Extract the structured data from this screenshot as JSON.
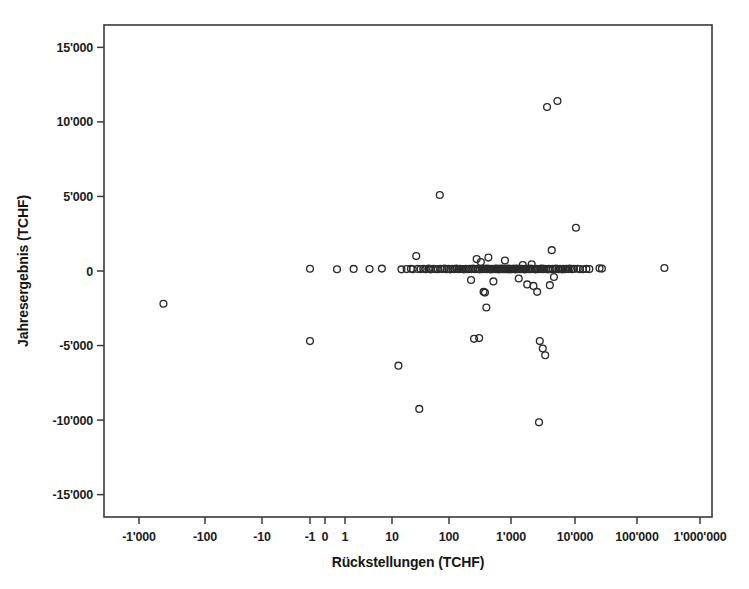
{
  "chart_data": {
    "type": "scatter",
    "title": "",
    "xlabel": "Rückstellungen (TCHF)",
    "ylabel": "Jahresergebnis (TCHF)",
    "xscale": "symlog",
    "yscale": "linear",
    "grid": false,
    "legend": false,
    "marker_style": "open-circle",
    "marker_color": "#2b2b2b",
    "x_tick_labels": [
      "-1'000",
      "-100",
      "-10",
      "-1",
      "0",
      "1",
      "10",
      "100",
      "1'000",
      "10'000",
      "100'000",
      "1'000'000"
    ],
    "x_tick_values": [
      -1000,
      -100,
      -10,
      -1,
      0,
      1,
      10,
      100,
      1000,
      10000,
      100000,
      1000000
    ],
    "x_tick_px": [
      139,
      205,
      262,
      310,
      325,
      345,
      392,
      449,
      511,
      575,
      637,
      700
    ],
    "y_tick_labels": [
      "15'000",
      "10'000",
      "5'000",
      "0",
      "-5'000",
      "-10'000",
      "-15'000"
    ],
    "y_tick_values": [
      15000,
      10000,
      5000,
      0,
      -5000,
      -10000,
      -15000
    ],
    "ylim": [
      -16500,
      16500
    ],
    "xlim_px": [
      104,
      712
    ],
    "ylim_px": [
      25,
      517
    ],
    "points": [
      [
        -300,
        -2200
      ],
      [
        -1,
        -4700
      ],
      [
        -1,
        150
      ],
      [
        0.6,
        120
      ],
      [
        1.4,
        140
      ],
      [
        2.6,
        130
      ],
      [
        4.2,
        160
      ],
      [
        8,
        -6350
      ],
      [
        9,
        110
      ],
      [
        11,
        130
      ],
      [
        13,
        150
      ],
      [
        14,
        120
      ],
      [
        16,
        1000
      ],
      [
        17,
        140
      ],
      [
        18,
        -9250
      ],
      [
        19,
        130
      ],
      [
        21,
        150
      ],
      [
        23,
        120
      ],
      [
        26,
        160
      ],
      [
        28,
        110
      ],
      [
        31,
        140
      ],
      [
        34,
        130
      ],
      [
        37,
        120
      ],
      [
        40,
        5100
      ],
      [
        41,
        150
      ],
      [
        44,
        130
      ],
      [
        48,
        170
      ],
      [
        52,
        120
      ],
      [
        56,
        140
      ],
      [
        60,
        110
      ],
      [
        65,
        150
      ],
      [
        70,
        130
      ],
      [
        76,
        160
      ],
      [
        82,
        120
      ],
      [
        88,
        140
      ],
      [
        95,
        130
      ],
      [
        102,
        110
      ],
      [
        110,
        150
      ],
      [
        118,
        120
      ],
      [
        127,
        140
      ],
      [
        135,
        -600
      ],
      [
        137,
        130
      ],
      [
        146,
        160
      ],
      [
        152,
        -4550
      ],
      [
        157,
        120
      ],
      [
        168,
        800
      ],
      [
        172,
        140
      ],
      [
        178,
        130
      ],
      [
        185,
        -4500
      ],
      [
        190,
        110
      ],
      [
        198,
        600
      ],
      [
        205,
        150
      ],
      [
        212,
        120
      ],
      [
        220,
        -1400
      ],
      [
        228,
        140
      ],
      [
        232,
        -1450
      ],
      [
        238,
        130
      ],
      [
        245,
        -2450
      ],
      [
        250,
        160
      ],
      [
        258,
        120
      ],
      [
        265,
        900
      ],
      [
        272,
        140
      ],
      [
        280,
        130
      ],
      [
        290,
        110
      ],
      [
        300,
        150
      ],
      [
        312,
        120
      ],
      [
        322,
        -700
      ],
      [
        335,
        140
      ],
      [
        348,
        130
      ],
      [
        360,
        160
      ],
      [
        372,
        120
      ],
      [
        385,
        140
      ],
      [
        398,
        110
      ],
      [
        412,
        150
      ],
      [
        428,
        130
      ],
      [
        442,
        170
      ],
      [
        458,
        120
      ],
      [
        472,
        140
      ],
      [
        488,
        130
      ],
      [
        505,
        700
      ],
      [
        520,
        120
      ],
      [
        538,
        150
      ],
      [
        556,
        130
      ],
      [
        575,
        160
      ],
      [
        595,
        110
      ],
      [
        615,
        140
      ],
      [
        635,
        130
      ],
      [
        655,
        120
      ],
      [
        678,
        150
      ],
      [
        700,
        140
      ],
      [
        725,
        130
      ],
      [
        750,
        110
      ],
      [
        778,
        160
      ],
      [
        805,
        120
      ],
      [
        835,
        140
      ],
      [
        865,
        -500
      ],
      [
        880,
        130
      ],
      [
        910,
        150
      ],
      [
        940,
        120
      ],
      [
        975,
        140
      ],
      [
        1010,
        400
      ],
      [
        1045,
        130
      ],
      [
        1080,
        110
      ],
      [
        1120,
        150
      ],
      [
        1160,
        120
      ],
      [
        1200,
        -900
      ],
      [
        1240,
        140
      ],
      [
        1285,
        130
      ],
      [
        1330,
        160
      ],
      [
        1380,
        120
      ],
      [
        1430,
        450
      ],
      [
        1480,
        140
      ],
      [
        1530,
        -1000
      ],
      [
        1590,
        130
      ],
      [
        1650,
        110
      ],
      [
        1710,
        150
      ],
      [
        1770,
        -1400
      ],
      [
        1830,
        120
      ],
      [
        1900,
        -10150
      ],
      [
        1960,
        -4700
      ],
      [
        1985,
        140
      ],
      [
        2050,
        130
      ],
      [
        2130,
        160
      ],
      [
        2200,
        -5200
      ],
      [
        2260,
        120
      ],
      [
        2340,
        140
      ],
      [
        2420,
        -5650
      ],
      [
        2500,
        130
      ],
      [
        2600,
        11000
      ],
      [
        2700,
        110
      ],
      [
        2800,
        150
      ],
      [
        2900,
        -950
      ],
      [
        3000,
        120
      ],
      [
        3120,
        1400
      ],
      [
        3250,
        140
      ],
      [
        3400,
        -400
      ],
      [
        3550,
        130
      ],
      [
        3700,
        160
      ],
      [
        3900,
        11400
      ],
      [
        4100,
        120
      ],
      [
        4300,
        140
      ],
      [
        4500,
        130
      ],
      [
        4700,
        110
      ],
      [
        4900,
        150
      ],
      [
        5200,
        120
      ],
      [
        5500,
        140
      ],
      [
        5900,
        130
      ],
      [
        6300,
        160
      ],
      [
        6800,
        120
      ],
      [
        7400,
        140
      ],
      [
        8000,
        2900
      ],
      [
        8600,
        150
      ],
      [
        9300,
        130
      ],
      [
        10500,
        120
      ],
      [
        12000,
        140
      ],
      [
        13500,
        130
      ],
      [
        20000,
        180
      ],
      [
        22000,
        160
      ],
      [
        250000,
        200
      ]
    ]
  }
}
